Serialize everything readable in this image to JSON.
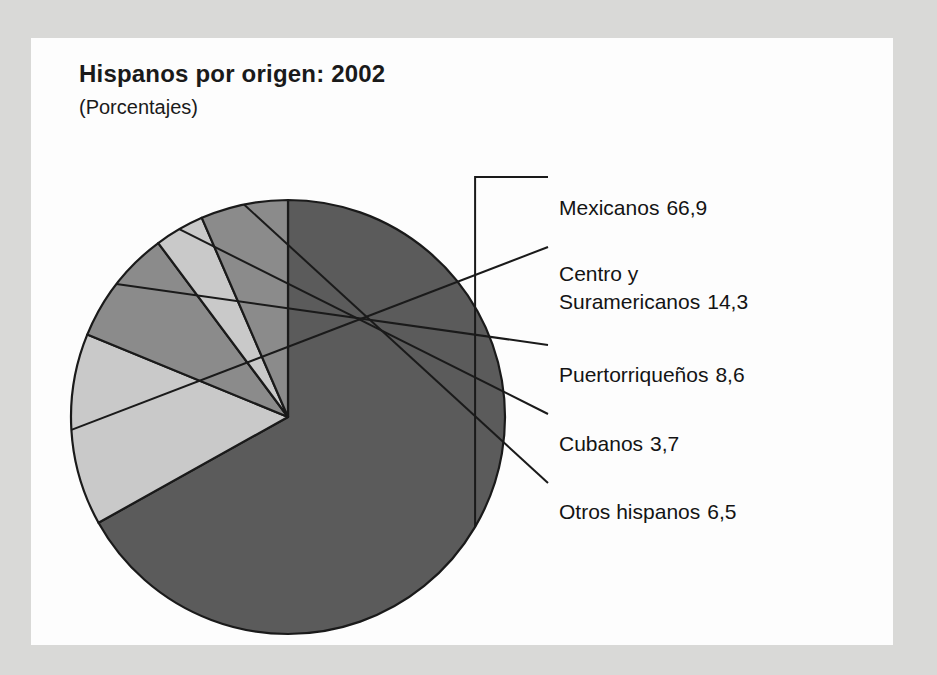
{
  "chart_data": {
    "type": "pie",
    "title": "Hispanos por origen: 2002",
    "subtitle": "(Porcentajes)",
    "xlabel": "",
    "ylabel": "",
    "units": "percent",
    "legend_position": "right",
    "grid": false,
    "categories": [
      "Mexicanos",
      "Centro y Suramericanos",
      "Puertorriqueños",
      "Cubanos",
      "Otros hispanos"
    ],
    "values": [
      66.9,
      14.3,
      8.6,
      3.7,
      6.5
    ],
    "value_labels": [
      "66,9",
      "14,3",
      "8,6",
      "3,7",
      "6,5"
    ],
    "colors": [
      "#5b5b5b",
      "#c9c9c9",
      "#8b8b8b",
      "#c9c9c9",
      "#8b8b8b"
    ],
    "slices": [
      {
        "name": "Mexicanos",
        "value": 66.9,
        "value_label": "66,9",
        "color": "#5b5b5b",
        "label_line1": "Mexicanos",
        "label_line2": ""
      },
      {
        "name": "Centro y Suramericanos",
        "value": 14.3,
        "value_label": "14,3",
        "color": "#c9c9c9",
        "label_line1": "Centro y",
        "label_line2": "Suramericanos"
      },
      {
        "name": "Puertorriqueños",
        "value": 8.6,
        "value_label": "8,6",
        "color": "#8b8b8b",
        "label_line1": "Puertorriqueños",
        "label_line2": ""
      },
      {
        "name": "Cubanos",
        "value": 3.7,
        "value_label": "3,7",
        "color": "#c9c9c9",
        "label_line1": "Cubanos",
        "label_line2": ""
      },
      {
        "name": "Otros hispanos",
        "value": 6.5,
        "value_label": "6,5",
        "color": "#8b8b8b",
        "label_line1": "Otros hispanos",
        "label_line2": ""
      }
    ]
  },
  "legend": [
    {
      "line1": "Mexicanos",
      "line2": "",
      "value": "66,9"
    },
    {
      "line1": "Centro y",
      "line2": "Suramericanos",
      "value": "14,3"
    },
    {
      "line1": "Puertorriqueños",
      "line2": "",
      "value": "8,6"
    },
    {
      "line1": "Cubanos",
      "line2": "",
      "value": "3,7"
    },
    {
      "line1": "Otros hispanos",
      "line2": "",
      "value": "6,5"
    }
  ]
}
